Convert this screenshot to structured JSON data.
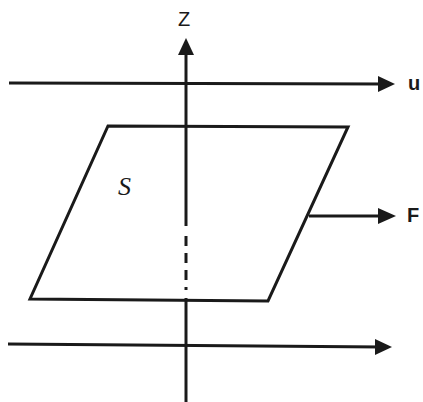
{
  "diagram": {
    "labels": {
      "z_axis": "Z",
      "flow_top": "u",
      "force": "F",
      "surface": "S"
    },
    "colors": {
      "stroke": "#1a1a1a",
      "background": "#ffffff"
    },
    "elements": [
      {
        "type": "axis",
        "name": "z-axis",
        "direction": "up"
      },
      {
        "type": "arrow",
        "name": "flow-arrow-top",
        "label": "u"
      },
      {
        "type": "arrow",
        "name": "flow-arrow-bottom"
      },
      {
        "type": "parallelogram",
        "name": "surface-S",
        "label": "S"
      },
      {
        "type": "arrow",
        "name": "force-arrow",
        "label": "F"
      }
    ]
  }
}
